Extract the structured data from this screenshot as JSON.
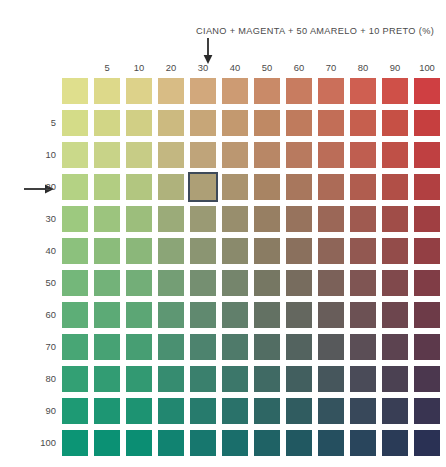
{
  "title": "CIANO + MAGENTA + 50 AMARELO + 10 PRETO (%)",
  "axes": {
    "column_label": "CIANO (%)",
    "row_label": "MAGENTA (%)",
    "column_ticks": [
      "",
      "5",
      "10",
      "20",
      "30",
      "40",
      "50",
      "60",
      "70",
      "80",
      "90",
      "100"
    ],
    "row_ticks": [
      "",
      "5",
      "10",
      "20",
      "30",
      "40",
      "50",
      "60",
      "70",
      "80",
      "90",
      "100"
    ]
  },
  "markers": {
    "column_arrow_tick": "30",
    "row_arrow_tick": "20",
    "highlight_column_index": 4,
    "highlight_row_index": 3,
    "highlight_color": "#3e4a59"
  },
  "chart_data": {
    "type": "heatmap",
    "title": "CIANO + MAGENTA + 50 AMARELO + 10 PRETO (%)",
    "xlabel": "MAGENTA (%)",
    "ylabel": "CIANO (%)",
    "x": [
      0,
      5,
      10,
      20,
      30,
      40,
      50,
      60,
      70,
      80,
      90,
      100
    ],
    "y": [
      0,
      5,
      10,
      20,
      30,
      40,
      50,
      60,
      70,
      80,
      90,
      100
    ],
    "grid": false,
    "legend": "none",
    "constant_inks": {
      "amarelo": 50,
      "preto": 10
    },
    "colors": [
      [
        "#dfdf8d",
        "#ddd98a",
        "#ddd28a",
        "#d8bc85",
        "#d2a87c",
        "#cd9b73",
        "#c98a68",
        "#c87c60",
        "#cb6f5a",
        "#cf5f51",
        "#cf5048",
        "#cf3f42"
      ],
      [
        "#d4dc88",
        "#d2d686",
        "#d1cf85",
        "#ccba80",
        "#c7a678",
        "#c3996f",
        "#bf8964",
        "#bf7b5d",
        "#c26e57",
        "#c65f4e",
        "#c65045",
        "#c63f3f"
      ],
      [
        "#cad98a",
        "#c8d388",
        "#c7cc86",
        "#c3b781",
        "#bfa47a",
        "#bb9771",
        "#b88766",
        "#b87a5f",
        "#bb6d58",
        "#bf5e50",
        "#bf5047",
        "#bf4041"
      ],
      [
        "#b4d284",
        "#b2cd82",
        "#b2c680",
        "#afb27c",
        "#ad9f76",
        "#aa936e",
        "#a88463",
        "#a8775d",
        "#ac6b57",
        "#b05d4f",
        "#b14f47",
        "#b14041"
      ],
      [
        "#9dc97f",
        "#9cc47e",
        "#9cbe7c",
        "#9bab79",
        "#9a9a74",
        "#988e6d",
        "#977f63",
        "#97735d",
        "#9b6757",
        "#9f5a50",
        "#a04d48",
        "#a03f42"
      ],
      [
        "#8cc17d",
        "#8bbc7b",
        "#8bb77a",
        "#8ba577",
        "#8b9572",
        "#8a8a6c",
        "#8a7c63",
        "#8a705d",
        "#8e6558",
        "#925851",
        "#934c4a",
        "#933f44"
      ],
      [
        "#74b77a",
        "#73b279",
        "#73ae78",
        "#749e75",
        "#758f71",
        "#75856c",
        "#767763",
        "#776c5e",
        "#7b6159",
        "#7f5553",
        "#80494c",
        "#803d46"
      ],
      [
        "#5dae77",
        "#5caa76",
        "#5ca675",
        "#5e9773",
        "#60896f",
        "#617f6b",
        "#637163",
        "#64675f",
        "#685d5a",
        "#6c5154",
        "#6d464e",
        "#6d3b48"
      ],
      [
        "#48a675",
        "#47a274",
        "#479e73",
        "#4a9071",
        "#4d836e",
        "#4f7a6a",
        "#526d63",
        "#53635f",
        "#57595b",
        "#5b4e56",
        "#5c4350",
        "#5c394b"
      ],
      [
        "#33a074",
        "#329c73",
        "#329972",
        "#368c70",
        "#3a806d",
        "#3c776a",
        "#406a64",
        "#425f5f",
        "#46565c",
        "#4a4b58",
        "#4b4152",
        "#4b374e"
      ],
      [
        "#1e9a74",
        "#1d9673",
        "#1d9372",
        "#228770",
        "#277b6d",
        "#2a726a",
        "#2e6664",
        "#305c60",
        "#34535e",
        "#38485a",
        "#393e55",
        "#393451"
      ],
      [
        "#0c9575",
        "#0b9174",
        "#0b8e73",
        "#118371",
        "#17776e",
        "#1a6e6b",
        "#1f6265",
        "#215861",
        "#254f5f",
        "#29455c",
        "#2a3b57",
        "#2a3154"
      ]
    ]
  }
}
